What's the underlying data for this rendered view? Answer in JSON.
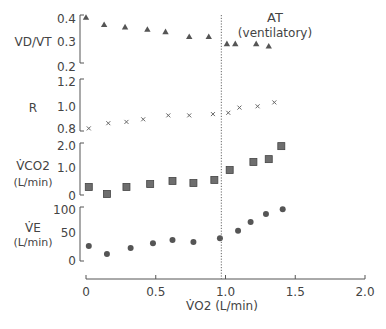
{
  "chart_data": {
    "type": "scatter",
    "title": "",
    "xlabel": "V̇O2 (L/min)",
    "x_ticks": [
      "0",
      "0.5",
      "1.0",
      "1.5",
      "2.0"
    ],
    "xlim": [
      0,
      2.0
    ],
    "grid": false,
    "legend": null,
    "annotation": {
      "label_line1": "AT",
      "label_line2": "(ventilatory)",
      "type": "vertical-dotted-line",
      "x": 0.97
    },
    "panels": [
      {
        "name": "VD/VT",
        "ylabel": "VD/VT",
        "ylabel_sub": "",
        "marker": "triangle",
        "y_ticks": [
          "0.4",
          "0.3",
          "0.2"
        ],
        "ylim": [
          0.2,
          0.4
        ],
        "x": [
          0.0,
          0.13,
          0.28,
          0.44,
          0.57,
          0.74,
          0.88,
          1.01,
          1.07,
          1.22,
          1.31
        ],
        "values": [
          0.39,
          0.36,
          0.35,
          0.34,
          0.33,
          0.31,
          0.31,
          0.28,
          0.28,
          0.28,
          0.27
        ]
      },
      {
        "name": "R",
        "ylabel": "R",
        "ylabel_sub": "",
        "marker": "x",
        "y_ticks": [
          "1.2",
          "1.0",
          "0.8"
        ],
        "ylim": [
          0.8,
          1.2
        ],
        "x": [
          0.02,
          0.16,
          0.29,
          0.41,
          0.59,
          0.74,
          0.91,
          1.02,
          1.1,
          1.23,
          1.35
        ],
        "values": [
          0.82,
          0.86,
          0.87,
          0.89,
          0.92,
          0.92,
          0.93,
          0.94,
          0.98,
          0.99,
          1.02
        ]
      },
      {
        "name": "VCO2",
        "ylabel": "V̇CO2",
        "ylabel_sub": "(L/min)",
        "marker": "square",
        "y_ticks": [
          "2.0",
          "1.0",
          "0"
        ],
        "ylim": [
          0,
          2.0
        ],
        "x": [
          0.02,
          0.15,
          0.29,
          0.46,
          0.62,
          0.77,
          0.92,
          1.03,
          1.2,
          1.31,
          1.4
        ],
        "values": [
          0.31,
          0.04,
          0.31,
          0.42,
          0.54,
          0.46,
          0.58,
          0.96,
          1.27,
          1.38,
          1.88
        ]
      },
      {
        "name": "VE",
        "ylabel": "V̇E",
        "ylabel_sub": "(L/min)",
        "marker": "circle",
        "y_ticks": [
          "100",
          "50",
          "0"
        ],
        "ylim": [
          0,
          100
        ],
        "x": [
          0.02,
          0.15,
          0.32,
          0.48,
          0.62,
          0.77,
          0.96,
          1.09,
          1.18,
          1.29,
          1.41
        ],
        "values": [
          28,
          13,
          24,
          33,
          39,
          35,
          42,
          56,
          72,
          87,
          96
        ]
      }
    ]
  }
}
